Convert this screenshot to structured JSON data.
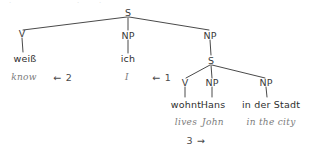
{
  "figure": {
    "stroke_color": "#4a4a4a",
    "label_color": "#3a3a3a",
    "gloss_color": "#7b7b7b"
  },
  "nodes": {
    "root_s": "S",
    "v_matrix": "V",
    "np_subject": "NP",
    "np_clausal": "NP",
    "s_embedded": "S",
    "v_embedded": "V",
    "np_embedded_subject": "NP",
    "np_locative": "NP"
  },
  "terminals": {
    "weiss": "weiß",
    "ich": "ich",
    "wohnt": "wohnt",
    "hans": "Hans",
    "in_der_stadt": "in der Stadt"
  },
  "glosses": {
    "know": "know",
    "i": "I",
    "lives": "lives",
    "john": "John",
    "in_the_city": "in the city"
  },
  "movement_markers": {
    "marker_two": "← 2",
    "marker_one": "← 1",
    "marker_three": "3 →"
  }
}
